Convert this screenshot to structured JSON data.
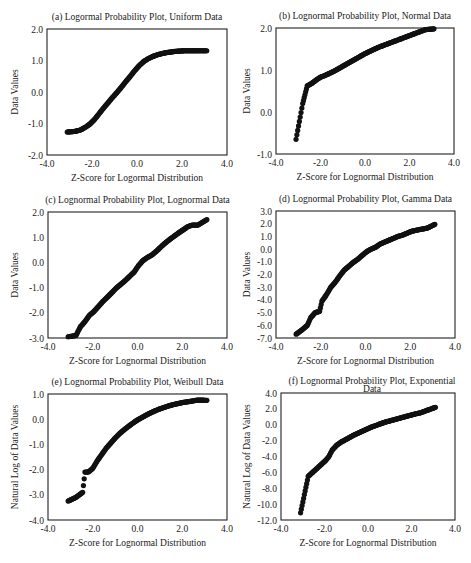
{
  "chart_data": [
    {
      "id": "a",
      "type": "scatter",
      "title": "(a) Logormal Probability Plot, Uniform Data",
      "xlabel": "Z-Score for Logormal Distribution",
      "ylabel": "Data Values",
      "xlim": [
        -4.0,
        4.0
      ],
      "ylim": [
        -2.0,
        2.0
      ],
      "xticks": [
        "-4.0",
        "-2.0",
        "0.0",
        "2.0",
        "4.0"
      ],
      "yticks": [
        "2.0",
        "1.0",
        "0.0",
        "-1.0",
        "-2.0"
      ],
      "grid": false,
      "curve": {
        "x": [
          -3.1,
          -2.75,
          -2.5,
          -2.3,
          -2.1,
          -1.9,
          -1.7,
          -1.5,
          -1.3,
          -1.1,
          -0.9,
          -0.7,
          -0.5,
          -0.3,
          -0.1,
          0.1,
          0.3,
          0.5,
          0.7,
          0.9,
          1.1,
          1.3,
          1.5,
          1.7,
          1.9,
          2.1,
          2.3,
          2.5,
          2.7,
          3.1
        ],
        "y": [
          -1.27,
          -1.25,
          -1.2,
          -1.12,
          -1.02,
          -0.88,
          -0.7,
          -0.52,
          -0.35,
          -0.18,
          -0.02,
          0.15,
          0.33,
          0.5,
          0.68,
          0.84,
          0.97,
          1.06,
          1.13,
          1.18,
          1.22,
          1.25,
          1.27,
          1.29,
          1.3,
          1.31,
          1.31,
          1.31,
          1.31,
          1.31
        ]
      }
    },
    {
      "id": "b",
      "type": "scatter",
      "title": "(b) Lognormal Probability Plot, Normal Data",
      "xlabel": "Z-Score for Lognormal Distribution",
      "ylabel": "Data Values",
      "xlim": [
        -4.0,
        4.0
      ],
      "ylim": [
        -1.0,
        2.0
      ],
      "xticks": [
        "-4.0",
        "-2.0",
        "0.0",
        "2.0",
        "4.0"
      ],
      "yticks": [
        "2.0",
        "1.0",
        "0.0",
        "-1.0"
      ],
      "grid": false,
      "curve": {
        "x": [
          -3.1,
          -2.8,
          -2.6,
          -2.4,
          -2.2,
          -2.0,
          -1.8,
          -1.6,
          -1.4,
          -1.2,
          -1.0,
          -0.8,
          -0.6,
          -0.4,
          -0.2,
          0.0,
          0.2,
          0.4,
          0.6,
          0.8,
          1.0,
          1.2,
          1.4,
          1.6,
          1.8,
          2.0,
          2.2,
          2.4,
          2.7,
          3.1
        ],
        "y": [
          -0.65,
          0.2,
          0.62,
          0.68,
          0.76,
          0.83,
          0.87,
          0.92,
          0.97,
          1.03,
          1.09,
          1.15,
          1.21,
          1.27,
          1.33,
          1.39,
          1.44,
          1.49,
          1.54,
          1.58,
          1.62,
          1.66,
          1.7,
          1.74,
          1.78,
          1.82,
          1.86,
          1.9,
          1.96,
          1.98
        ]
      }
    },
    {
      "id": "c",
      "type": "scatter",
      "title": "(c) Lognormal Probability Plot, Lognormal Data",
      "xlabel": "Z-Score for Lognormal Distribution",
      "ylabel": "Data Values",
      "xlim": [
        -4.0,
        4.0
      ],
      "ylim": [
        -3.0,
        2.0
      ],
      "xticks": [
        "-4.0",
        "-2.0",
        "0.0",
        "2.0",
        "4.0"
      ],
      "yticks": [
        "2.0",
        "1.0",
        "0.0",
        "-1.0",
        "-2.0",
        "-3.0"
      ],
      "grid": false,
      "curve": {
        "x": [
          -3.1,
          -2.75,
          -2.55,
          -2.35,
          -2.15,
          -1.95,
          -1.75,
          -1.55,
          -1.35,
          -1.15,
          -0.95,
          -0.75,
          -0.55,
          -0.35,
          -0.15,
          0.05,
          0.25,
          0.45,
          0.65,
          0.85,
          1.05,
          1.25,
          1.45,
          1.65,
          1.85,
          2.05,
          2.25,
          2.45,
          2.7,
          3.1
        ],
        "y": [
          -2.95,
          -2.9,
          -2.55,
          -2.35,
          -2.1,
          -1.95,
          -1.75,
          -1.55,
          -1.38,
          -1.2,
          -1.02,
          -0.87,
          -0.72,
          -0.55,
          -0.38,
          -0.12,
          0.08,
          0.2,
          0.3,
          0.45,
          0.62,
          0.78,
          0.92,
          1.05,
          1.18,
          1.3,
          1.42,
          1.48,
          1.48,
          1.7
        ]
      }
    },
    {
      "id": "d",
      "type": "scatter",
      "title": "(d) Lognormal Probability Plot, Gamma Data",
      "xlabel": "Z-Score for Lognormal Distribution",
      "ylabel": "Data Values",
      "xlim": [
        -4.0,
        4.0
      ],
      "ylim": [
        -7.0,
        3.0
      ],
      "xticks": [
        "-4.0",
        "-2.0",
        "0.0",
        "2.0",
        "4.0"
      ],
      "yticks": [
        "3.0",
        "2.0",
        "1.0",
        "0.0",
        "-1.0",
        "-2.0",
        "-3.0",
        "-4.0",
        "-5.0",
        "-6.0",
        "-7.0"
      ],
      "grid": false,
      "curve": {
        "x": [
          -3.1,
          -2.8,
          -2.6,
          -2.45,
          -2.25,
          -2.05,
          -1.95,
          -1.75,
          -1.55,
          -1.35,
          -1.15,
          -0.95,
          -0.75,
          -0.55,
          -0.35,
          -0.15,
          0.05,
          0.25,
          0.45,
          0.65,
          0.85,
          1.05,
          1.25,
          1.45,
          1.65,
          1.85,
          2.05,
          2.3,
          2.75,
          3.1
        ],
        "y": [
          -6.7,
          -6.3,
          -6.0,
          -5.4,
          -5.0,
          -4.9,
          -4.1,
          -3.6,
          -3.0,
          -2.6,
          -2.1,
          -1.65,
          -1.35,
          -1.05,
          -0.8,
          -0.5,
          -0.2,
          0.0,
          0.15,
          0.4,
          0.55,
          0.7,
          0.85,
          1.0,
          1.1,
          1.25,
          1.4,
          1.5,
          1.65,
          1.95
        ]
      }
    },
    {
      "id": "e",
      "type": "scatter",
      "title": "(e) Lognormal Probability Plot, Weibull Data",
      "xlabel": "Z-Score for Lognormal Distribution",
      "ylabel": "Natural Log of Data Values",
      "xlim": [
        -4.0,
        4.0
      ],
      "ylim": [
        -4.0,
        1.0
      ],
      "xticks": [
        "-4.0",
        "-2.0",
        "0.0",
        "2.0",
        "4.0"
      ],
      "yticks": [
        "1.0",
        "0.0",
        "-1.0",
        "-2.0",
        "-3.0",
        "-4.0"
      ],
      "grid": false,
      "curve": {
        "x": [
          -3.1,
          -2.75,
          -2.6,
          -2.45,
          -2.35,
          -2.2,
          -2.0,
          -1.8,
          -1.6,
          -1.4,
          -1.2,
          -1.0,
          -0.8,
          -0.6,
          -0.4,
          -0.2,
          0.0,
          0.2,
          0.4,
          0.6,
          0.8,
          1.0,
          1.2,
          1.4,
          1.6,
          1.8,
          2.0,
          2.3,
          2.7,
          3.1
        ],
        "y": [
          -3.25,
          -3.1,
          -3.0,
          -2.9,
          -2.1,
          -2.1,
          -1.95,
          -1.65,
          -1.4,
          -1.15,
          -0.95,
          -0.75,
          -0.57,
          -0.42,
          -0.28,
          -0.15,
          -0.03,
          0.07,
          0.17,
          0.26,
          0.34,
          0.41,
          0.47,
          0.53,
          0.58,
          0.62,
          0.66,
          0.7,
          0.76,
          0.75
        ]
      }
    },
    {
      "id": "f",
      "type": "scatter",
      "title": "(f) Lognormal Probability Plot, Exponential Data",
      "xlabel": "Z-Score for Lognormal Distribution",
      "ylabel": "Natural Log of Data Values",
      "xlim": [
        -4.0,
        4.0
      ],
      "ylim": [
        -12.0,
        4.0
      ],
      "xticks": [
        "-4.0",
        "-2.0",
        "0.0",
        "2.0",
        "4.0"
      ],
      "yticks": [
        "4.0",
        "2.0",
        "0.0",
        "-2.0",
        "-4.0",
        "-6.0",
        "-8.0",
        "-10.0",
        "-12.0"
      ],
      "grid": false,
      "curve": {
        "x": [
          -3.1,
          -2.75,
          -2.55,
          -2.35,
          -2.15,
          -1.95,
          -1.8,
          -1.65,
          -1.45,
          -1.25,
          -1.05,
          -0.85,
          -0.65,
          -0.45,
          -0.25,
          -0.05,
          0.15,
          0.35,
          0.55,
          0.75,
          0.95,
          1.15,
          1.35,
          1.55,
          1.75,
          1.95,
          2.15,
          2.4,
          2.7,
          3.1
        ],
        "y": [
          -11.1,
          -6.5,
          -6.0,
          -5.5,
          -5.0,
          -4.5,
          -4.0,
          -3.2,
          -2.6,
          -2.2,
          -1.9,
          -1.6,
          -1.3,
          -1.05,
          -0.8,
          -0.55,
          -0.3,
          -0.1,
          0.1,
          0.3,
          0.45,
          0.6,
          0.75,
          0.9,
          1.05,
          1.2,
          1.35,
          1.5,
          1.8,
          2.2
        ]
      }
    }
  ]
}
